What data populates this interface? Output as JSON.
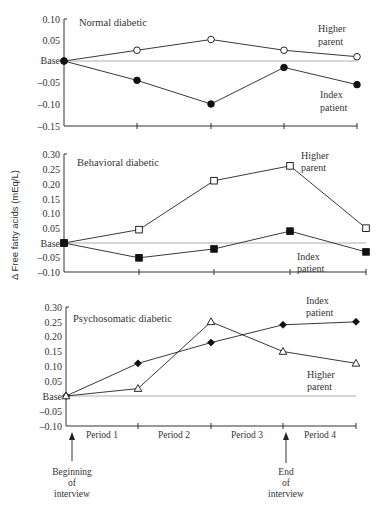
{
  "chart_data": [
    {
      "type": "line",
      "title": "Normal diabetic",
      "ylabel": "Δ Free fatty acids (mEq/L)",
      "x": [
        0,
        1,
        2,
        3,
        4
      ],
      "yticks": [
        "0.10",
        "0.05",
        "Base",
        "-0.05",
        "-0.10",
        "-0.15"
      ],
      "ylim": [
        -0.15,
        0.1
      ],
      "series": [
        {
          "name": "Higher parent",
          "marker": "open-circle",
          "values": [
            0,
            0.025,
            0.05,
            0.025,
            0.01
          ]
        },
        {
          "name": "Index patient",
          "marker": "filled-circle",
          "values": [
            0,
            -0.045,
            -0.1,
            -0.015,
            -0.055
          ]
        }
      ]
    },
    {
      "type": "line",
      "title": "Behavioral diabetic",
      "ylabel": "Δ Free fatty acids (mEq/L)",
      "x": [
        0,
        1,
        2,
        3,
        4
      ],
      "yticks": [
        "0.30",
        "0.25",
        "0.20",
        "0.15",
        "0.10",
        "0.05",
        "Base",
        "-0.05",
        "-0.10"
      ],
      "ylim": [
        -0.1,
        0.3
      ],
      "series": [
        {
          "name": "Higher parent",
          "marker": "open-square",
          "values": [
            0,
            0.045,
            0.21,
            0.26,
            0.05
          ]
        },
        {
          "name": "Index patient",
          "marker": "filled-square",
          "values": [
            0,
            -0.05,
            -0.02,
            0.04,
            -0.03
          ]
        }
      ]
    },
    {
      "type": "line",
      "title": "Psychosomatic diabetic",
      "ylabel": "Δ Free fatty acids (mEq/L)",
      "x": [
        0,
        1,
        2,
        3,
        4
      ],
      "yticks": [
        "0.30",
        "0.25",
        "0.20",
        "0.15",
        "0.10",
        "0.05",
        "Base",
        "-0.05",
        "-0.10"
      ],
      "ylim": [
        -0.1,
        0.3
      ],
      "series": [
        {
          "name": "Index patient",
          "marker": "filled-diamond",
          "values": [
            0,
            0.11,
            0.18,
            0.24,
            0.25
          ]
        },
        {
          "name": "Higher parent",
          "marker": "open-triangle",
          "values": [
            0,
            0.025,
            0.25,
            0.15,
            0.11
          ]
        }
      ]
    }
  ],
  "labels": {
    "ylabel": "Δ Free fatty acids (mEq/L)",
    "panel1_title": "Normal diabetic",
    "panel2_title": "Behavioral diabetic",
    "panel3_title": "Psychosomatic diabetic",
    "higher": "Higher",
    "parent": "parent",
    "index": "Index",
    "patient": "patient",
    "periods": [
      "Period 1",
      "Period 2",
      "Period 3",
      "Period 4"
    ],
    "begin": [
      "Beginning",
      "of",
      "interview"
    ],
    "end": [
      "End",
      "of",
      "interview"
    ],
    "p1_ticks": [
      "0.10",
      "0.05",
      "Base",
      "–0.05",
      "–0.10",
      "–0.15"
    ],
    "p23_ticks": [
      "0.30",
      "0.25",
      "0.20",
      "0.15",
      "0.10",
      "0.05",
      "Base",
      "–0.05",
      "–0.10"
    ]
  }
}
